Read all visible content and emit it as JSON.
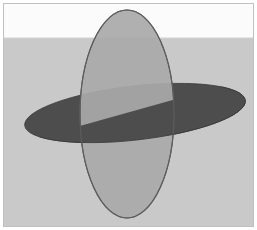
{
  "canvas": {
    "width": 257,
    "height": 230,
    "title": "Intersecting Ellipses Perspective Diagram",
    "background_color": "#ffffff"
  },
  "frame": {
    "border_color": "#c0c0c0",
    "border_width": 1,
    "inner_margin": 3
  },
  "scene": {
    "sky": {
      "label": "sky-band",
      "color": "#fbfbfb",
      "top": 4,
      "height": 34
    },
    "ground": {
      "label": "ground-plane",
      "color": "#c9c9c9",
      "top": 38,
      "height": 188
    },
    "horizon": {
      "label": "horizon-line",
      "y": 38,
      "color": "#d2d2d2"
    }
  },
  "shapes": {
    "horizontal_disk": {
      "name": "horizontal-ellipse",
      "description": "Dark horizontal disk seen in perspective",
      "fill": "#4d4d4d",
      "stroke": "#3a3a3a",
      "stroke_width": 0.8,
      "center_x": 135,
      "center_y": 113,
      "radius_x": 111,
      "radius_y": 27,
      "rotation_deg": -6.5
    },
    "vertical_ellipse": {
      "name": "vertical-ellipse",
      "description": "Light gray vertical ellipse standing upright",
      "fill": "#a9a9a9",
      "fill_opacity": 0.92,
      "stroke": "#5d5d5d",
      "stroke_width": 1.1,
      "center_x": 127,
      "center_y": 114,
      "radius_x": 47,
      "radius_y": 104,
      "rotation_deg": 0
    },
    "intersection": {
      "name": "intersection-points",
      "left_point_x": 80,
      "left_point_y": 126,
      "right_point_x": 173,
      "right_point_y": 100
    },
    "front_half_disk": {
      "name": "horizontal-ellipse-front-half",
      "description": "Near half of the dark disk drawn over the vertical ellipse",
      "fill": "#4d4d4d"
    }
  },
  "legend": {
    "items": [
      {
        "label": "Horizontal plane",
        "color": "#4d4d4d"
      },
      {
        "label": "Vertical plane",
        "color": "#a9a9a9"
      },
      {
        "label": "Ground",
        "color": "#c9c9c9"
      }
    ]
  }
}
